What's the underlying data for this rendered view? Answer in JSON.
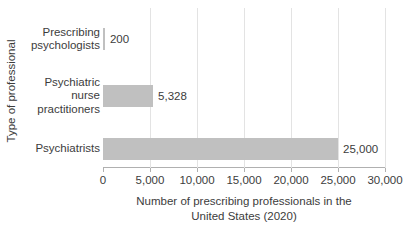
{
  "chart_data": {
    "type": "bar",
    "orientation": "horizontal",
    "title": "",
    "xlabel": "Number of prescribing professionals in the\nUnited States (2020)",
    "ylabel": "Type of professional",
    "categories": [
      "Prescribing\npsychologists",
      "Psychiatric\nnurse\npractitioners",
      "Psychiatrists"
    ],
    "values": [
      200,
      5328,
      25000
    ],
    "value_labels": [
      "200",
      "5,328",
      "25,000"
    ],
    "xlim": [
      0,
      30000
    ],
    "xticks": [
      0,
      5000,
      10000,
      15000,
      20000,
      25000,
      30000
    ],
    "xtick_labels": [
      "0",
      "5,000",
      "10,000",
      "15,000",
      "20,000",
      "25,000",
      "30,000"
    ],
    "grid": "vertical",
    "legend": "none",
    "bar_color": "#c0c0c0",
    "axis_color": "#b0b0b0",
    "gridline_color": "#e3e3e3",
    "text_color": "#3c3c3c",
    "background_color": "#ffffff"
  }
}
